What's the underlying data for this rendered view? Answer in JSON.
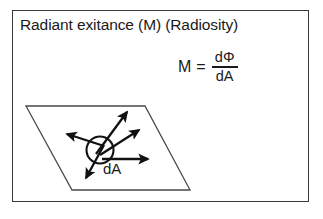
{
  "figure": {
    "title": "Radiant exitance (M) (Radiosity)",
    "frame_border_color": "#3a3a3a",
    "background_color": "#ffffff",
    "ink_color": "#1a1a1a"
  },
  "formula": {
    "lhs": "M",
    "equals": "=",
    "numerator": "dΦ",
    "denominator": "dA"
  },
  "diagram": {
    "surface_label": "dA",
    "surface_shape": "parallelogram",
    "emitter_shape": "circle",
    "arrow_count": 5,
    "arrow_directions": [
      "up-right-steep",
      "up-right-shallow",
      "right-horizontal",
      "left-upper",
      "down-left"
    ]
  }
}
